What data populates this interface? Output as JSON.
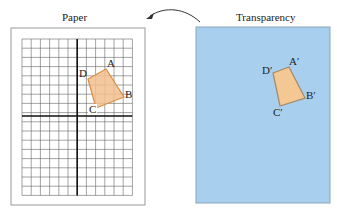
{
  "paper": {
    "title": "Paper",
    "frame": {
      "x": 11,
      "y": 28,
      "w": 134,
      "h": 177
    },
    "grid": {
      "x": 22,
      "y": 39,
      "cols": 12,
      "rows": 17,
      "cell": 9.2,
      "axis_col": 6,
      "axis_row": 8.4
    },
    "quad": {
      "points": "88,79 106,69 124,97 96,108",
      "labels": [
        {
          "text": "D",
          "x": 79,
          "y": 70
        },
        {
          "text": "A",
          "x": 107,
          "y": 58
        },
        {
          "text": "B",
          "x": 125,
          "y": 90
        },
        {
          "text": "C",
          "x": 88,
          "y": 104
        }
      ]
    }
  },
  "transparency": {
    "title": "Transparency",
    "rect": {
      "x": 196,
      "y": 27,
      "w": 134,
      "h": 176
    },
    "quad": {
      "points": "273,73 289,67 305,98 280,106",
      "labels": [
        {
          "text": "D′",
          "x": 262,
          "y": 65
        },
        {
          "text": "A′",
          "x": 289,
          "y": 56
        },
        {
          "text": "B′",
          "x": 306,
          "y": 91
        },
        {
          "text": "C′",
          "x": 273,
          "y": 108
        }
      ]
    }
  },
  "arrow": {
    "direction": "transparency-to-paper"
  },
  "colors": {
    "transparency_fill": "#a9cfee",
    "transparency_border": "#8aa5b8",
    "quad_fill": "#f2c08e",
    "quad_stroke": "#d9914a",
    "grid_line": "#555555",
    "axis_line": "#111111",
    "frame_line": "#999999"
  }
}
